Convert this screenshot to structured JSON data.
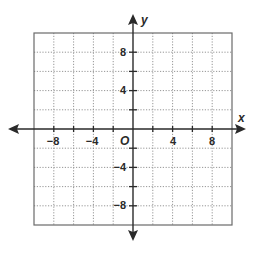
{
  "diagram": {
    "type": "coordinate-plane",
    "x_axis": {
      "name": "x",
      "range": [
        -10,
        10
      ],
      "grid_step": 2,
      "tick_labels": [
        {
          "value": -8,
          "label": "−8"
        },
        {
          "value": -4,
          "label": "−4"
        },
        {
          "value": 4,
          "label": "4"
        },
        {
          "value": 8,
          "label": "8"
        }
      ]
    },
    "y_axis": {
      "name": "y",
      "range": [
        -10,
        10
      ],
      "grid_step": 2,
      "tick_labels": [
        {
          "value": 8,
          "label": "8"
        },
        {
          "value": 4,
          "label": "4"
        },
        {
          "value": -4,
          "label": "−4"
        },
        {
          "value": -8,
          "label": "−8"
        }
      ]
    },
    "origin_label": "O",
    "colors": {
      "axis": "#2a2a2a",
      "border": "#6a6a6a",
      "grid": "#8a8a8a",
      "text": "#2a2a2a"
    }
  }
}
